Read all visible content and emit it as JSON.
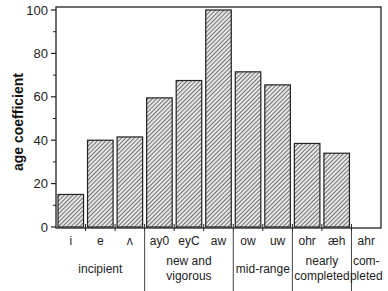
{
  "chart_data": {
    "type": "bar",
    "title": "",
    "xlabel": "",
    "ylabel": "age coefficient",
    "ylim": [
      0,
      100
    ],
    "yticks": [
      0,
      20,
      40,
      60,
      80,
      100
    ],
    "grid": false,
    "legend": null,
    "categories": [
      "i",
      "e",
      "ʌ",
      "ay0",
      "eyC",
      "aw",
      "ow",
      "uw",
      "ohr",
      "æh",
      "ahr"
    ],
    "values": [
      15,
      40,
      41.5,
      59.5,
      67.5,
      100,
      71.5,
      65.5,
      38.5,
      34,
      0
    ],
    "groups": [
      {
        "label": [
          "incipient"
        ],
        "categories": [
          "i",
          "e",
          "ʌ"
        ]
      },
      {
        "label": [
          "new and",
          "vigorous"
        ],
        "categories": [
          "ay0",
          "eyC",
          "aw"
        ]
      },
      {
        "label": [
          "mid-range"
        ],
        "categories": [
          "ow",
          "uw"
        ]
      },
      {
        "label": [
          "nearly",
          "completed"
        ],
        "categories": [
          "ohr",
          "æh"
        ]
      },
      {
        "label": [
          "com-",
          "pleted"
        ],
        "categories": [
          "ahr"
        ]
      }
    ],
    "bar_fill": "diagonal hatch",
    "colors": {
      "bar_stroke": "#222222",
      "hatch": "#555555",
      "axis": "#222222"
    }
  }
}
